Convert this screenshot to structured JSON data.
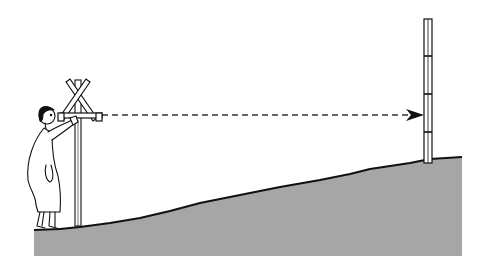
{
  "scene": {
    "description": "Surveyor sighting along a level line to a graduated staff on sloping ground",
    "colors": {
      "background": "#ffffff",
      "ground_fill": "#a6a6a6",
      "ink": "#111111"
    },
    "elements": [
      {
        "name": "surveyor-figure"
      },
      {
        "name": "sighting-cross-instrument"
      },
      {
        "name": "sight-line-dashed-arrow"
      },
      {
        "name": "graduated-staff"
      },
      {
        "name": "sloped-ground"
      }
    ]
  }
}
